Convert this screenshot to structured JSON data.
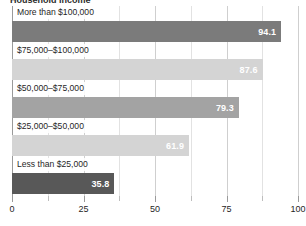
{
  "chart_data": {
    "type": "bar",
    "orientation": "horizontal",
    "title": "",
    "xlabel": "",
    "ylabel": "",
    "xlim": [
      0,
      100
    ],
    "grid": true,
    "legend": "none",
    "categories": [
      "More than $100,000",
      "$75,000–$100,000",
      "$50,000–$75,000",
      "$25,000–$50,000",
      "Less than $25,000"
    ],
    "values": [
      94.1,
      87.6,
      79.3,
      61.9,
      35.8
    ],
    "value_labels": [
      "94.1",
      "87.6",
      "79.3",
      "61.9",
      "35.8"
    ],
    "bar_colors": [
      "#7b7b7b",
      "#d4d4d4",
      "#a3a3a3",
      "#d4d4d4",
      "#585858"
    ],
    "xticks": [
      0,
      25,
      50,
      75,
      100
    ],
    "xtick_labels": [
      "0",
      "25",
      "50",
      "75",
      "100"
    ],
    "xticks_minor": [
      12.5,
      37.5,
      62.5,
      87.5
    ]
  },
  "title_sliver": {
    "text": "Household income"
  },
  "colors": {
    "background": "#ffffff",
    "axis": "#9a9a9a",
    "gridline_major": "#cfcfcf",
    "gridline_minor": "#e2e2e2",
    "text": "#1f1f1f",
    "value_text": "#ffffff"
  }
}
